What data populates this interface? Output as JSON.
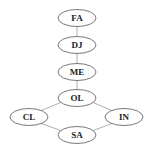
{
  "diagram": {
    "type": "graph",
    "nodes": [
      {
        "id": "FA",
        "label": "FA",
        "cx": 77,
        "cy": 18
      },
      {
        "id": "DJ",
        "label": "DJ",
        "cx": 77,
        "cy": 45
      },
      {
        "id": "ME",
        "label": "ME",
        "cx": 77,
        "cy": 72
      },
      {
        "id": "OL",
        "label": "OL",
        "cx": 77,
        "cy": 98
      },
      {
        "id": "CL",
        "label": "CL",
        "cx": 29,
        "cy": 117
      },
      {
        "id": "IN",
        "label": "IN",
        "cx": 124,
        "cy": 117
      },
      {
        "id": "SA",
        "label": "SA",
        "cx": 77,
        "cy": 135
      }
    ],
    "edges": [
      {
        "from": "FA",
        "to": "DJ"
      },
      {
        "from": "DJ",
        "to": "ME"
      },
      {
        "from": "ME",
        "to": "OL"
      },
      {
        "from": "OL",
        "to": "CL"
      },
      {
        "from": "OL",
        "to": "IN"
      },
      {
        "from": "CL",
        "to": "SA"
      },
      {
        "from": "IN",
        "to": "SA"
      }
    ]
  }
}
